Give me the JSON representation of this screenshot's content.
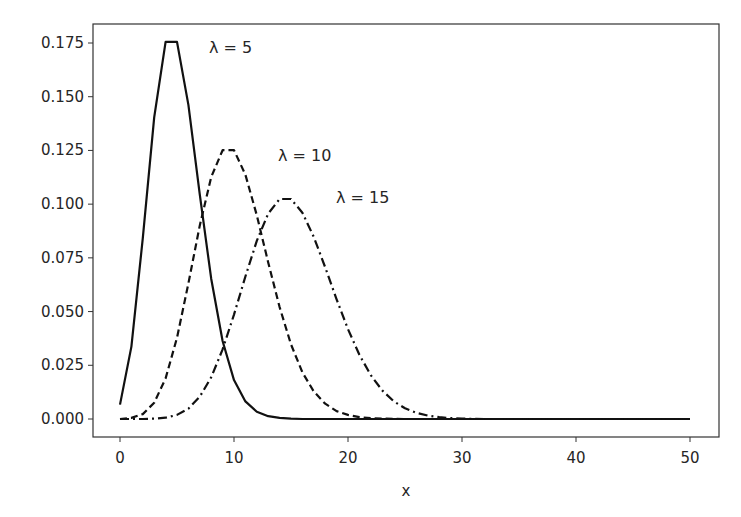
{
  "chart_data": {
    "type": "line",
    "title": "",
    "xlabel": "x",
    "ylabel": "",
    "xlim": [
      -2.5,
      52.5
    ],
    "ylim": [
      -0.0088,
      0.1842
    ],
    "grid": false,
    "legend": "none (inline annotations)",
    "x_ticks": [
      "0",
      "10",
      "20",
      "30",
      "40",
      "50"
    ],
    "y_ticks": [
      "0.000",
      "0.025",
      "0.050",
      "0.075",
      "0.100",
      "0.125",
      "0.150",
      "0.175"
    ],
    "x": [
      0,
      1,
      2,
      3,
      4,
      5,
      6,
      7,
      8,
      9,
      10,
      11,
      12,
      13,
      14,
      15,
      16,
      17,
      18,
      19,
      20,
      21,
      22,
      23,
      24,
      25,
      26,
      27,
      28,
      29,
      30,
      31,
      32,
      33,
      34,
      35,
      36,
      37,
      38,
      39,
      40,
      41,
      42,
      43,
      44,
      45,
      46,
      47,
      48,
      49,
      50
    ],
    "series": [
      {
        "name": "λ = 5",
        "style": "solid",
        "values": [
          0.0067,
          0.0337,
          0.0842,
          0.1404,
          0.1755,
          0.1755,
          0.1462,
          0.1044,
          0.0653,
          0.0363,
          0.0181,
          0.0082,
          0.0034,
          0.0013,
          0.0005,
          0.0002,
          0.0,
          0,
          0,
          0,
          0,
          0,
          0,
          0,
          0,
          0,
          0,
          0,
          0,
          0,
          0,
          0,
          0,
          0,
          0,
          0,
          0,
          0,
          0,
          0,
          0,
          0,
          0,
          0,
          0,
          0,
          0,
          0,
          0,
          0,
          0
        ]
      },
      {
        "name": "λ = 10",
        "style": "dashed",
        "values": [
          0.0,
          0.0005,
          0.0023,
          0.0076,
          0.0189,
          0.0378,
          0.0631,
          0.0901,
          0.1126,
          0.1251,
          0.1251,
          0.1137,
          0.0948,
          0.0729,
          0.0521,
          0.0347,
          0.0217,
          0.0128,
          0.0071,
          0.0037,
          0.0019,
          0.0009,
          0.0004,
          0.0002,
          0.0001,
          0.0,
          0,
          0,
          0,
          0,
          0,
          0,
          0,
          0,
          0,
          0,
          0,
          0,
          0,
          0,
          0,
          0,
          0,
          0,
          0,
          0,
          0,
          0,
          0,
          0,
          0
        ]
      },
      {
        "name": "λ = 15",
        "style": "dashdot",
        "values": [
          0.0,
          0.0,
          0.0,
          0.0002,
          0.0006,
          0.0019,
          0.0048,
          0.0104,
          0.0194,
          0.0324,
          0.0486,
          0.0663,
          0.0829,
          0.0956,
          0.1024,
          0.1024,
          0.096,
          0.0847,
          0.0706,
          0.0557,
          0.0418,
          0.0299,
          0.0204,
          0.0133,
          0.0083,
          0.005,
          0.0029,
          0.0016,
          0.0009,
          0.0004,
          0.0002,
          0.0001,
          0.0,
          0,
          0,
          0,
          0,
          0,
          0,
          0,
          0,
          0,
          0,
          0,
          0,
          0,
          0,
          0,
          0,
          0,
          0
        ]
      }
    ],
    "annotations": [
      {
        "text": "λ = 5",
        "x": 8,
        "y": 0.173
      },
      {
        "text": "λ = 10",
        "x": 14,
        "y": 0.122
      },
      {
        "text": "λ = 15",
        "x": 19,
        "y": 0.1
      }
    ]
  }
}
